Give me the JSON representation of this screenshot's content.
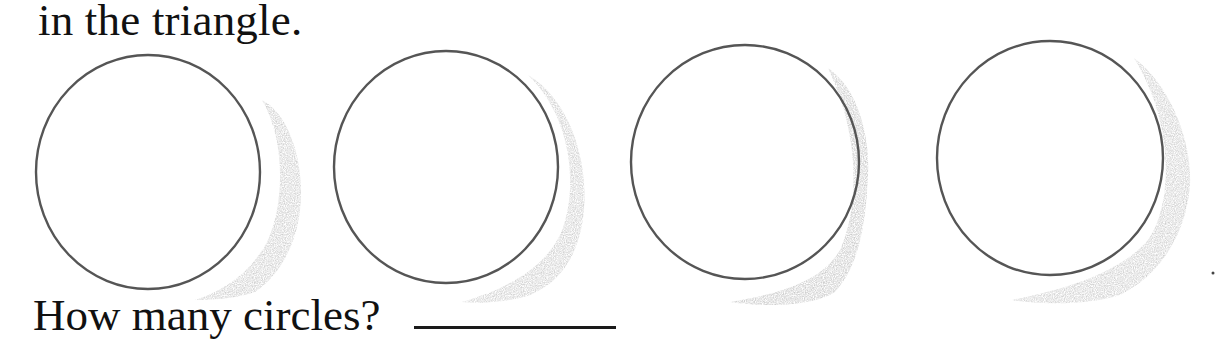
{
  "worksheet": {
    "heading_text": "in the triangle.",
    "question_text": "How many circles?",
    "answer": {
      "value": "",
      "line_style": "blank underline"
    },
    "circles": [
      {
        "index": 1,
        "cx": 148,
        "cy": 172,
        "rx": 112,
        "ry": 117
      },
      {
        "index": 2,
        "cx": 446,
        "cy": 167,
        "rx": 112,
        "ry": 116
      },
      {
        "index": 3,
        "cx": 745,
        "cy": 162,
        "rx": 114,
        "ry": 117
      },
      {
        "index": 4,
        "cx": 1050,
        "cy": 158,
        "rx": 113,
        "ry": 117
      }
    ],
    "colors": {
      "text": "#111111",
      "circle_stroke": "#555555",
      "shading": "#bdbdbd",
      "background": "#ffffff"
    }
  }
}
